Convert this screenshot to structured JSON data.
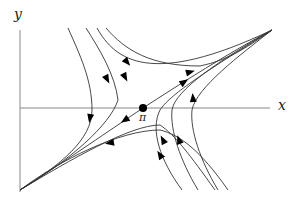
{
  "diagram": {
    "type": "phase-portrait",
    "axes": {
      "x_label": "x",
      "y_label": "y"
    },
    "equilibrium": {
      "label": "π",
      "kind": "saddle",
      "position": {
        "x": 143,
        "y": 108
      }
    },
    "colors": {
      "curve": "#333333",
      "axis": "#888888",
      "arrow": "#000000",
      "background": "#ffffff"
    },
    "curves": [
      {
        "name": "unstable-manifold",
        "path": "M20,190 C70,158 110,130 143,108 C180,84 230,52 272,30",
        "arrows": [
          {
            "x": 125,
            "y": 120,
            "angle": 146
          },
          {
            "x": 184,
            "y": 82,
            "angle": -34
          }
        ]
      },
      {
        "name": "stable-branch-upper-1",
        "path": "M68,28 C80,55 92,80 92,110 C92,140 60,165 20,190",
        "arrows": [
          {
            "x": 90,
            "y": 118,
            "angle": 100
          }
        ]
      },
      {
        "name": "stable-branch-upper-2",
        "path": "M86,28 C100,50 115,75 118,100 C110,125 70,160 20,190",
        "arrows": [
          {
            "x": 107,
            "y": 79,
            "angle": 62
          }
        ]
      },
      {
        "name": "upper-right-1",
        "path": "M97,28 C115,60 150,88 272,30",
        "arrows": [
          {
            "x": 125,
            "y": 77,
            "angle": 62
          }
        ]
      },
      {
        "name": "upper-right-2",
        "path": "M106,28 C125,50 150,66 200,66 C230,60 250,45 272,30",
        "arrows": [
          {
            "x": 127,
            "y": 62,
            "angle": 50
          },
          {
            "x": 190,
            "y": 72,
            "angle": -15
          }
        ]
      },
      {
        "name": "lower-left-1",
        "path": "M228,190 C200,150 180,135 160,130 C120,130 60,160 20,190",
        "arrows": [
          {
            "x": 110,
            "y": 143,
            "angle": 170
          }
        ]
      },
      {
        "name": "lower-left-2",
        "path": "M215,190 C190,155 175,135 160,125 C130,125 70,160 20,190",
        "arrows": [
          {
            "x": 160,
            "y": 155,
            "angle": -122
          }
        ]
      },
      {
        "name": "lower-right-1",
        "path": "M182,190 C160,160 150,130 160,110 C170,95 200,75 272,30",
        "arrows": [
          {
            "x": 163,
            "y": 140,
            "angle": -118
          }
        ]
      },
      {
        "name": "lower-right-2",
        "path": "M198,190 C180,160 170,130 172,110 C175,90 220,60 272,30",
        "arrows": [
          {
            "x": 179,
            "y": 140,
            "angle": -110
          }
        ]
      },
      {
        "name": "right-branch",
        "path": "M218,190 C200,160 190,130 192,110 C196,88 240,55 272,30",
        "arrows": [
          {
            "x": 193,
            "y": 98,
            "angle": -95
          }
        ]
      }
    ]
  }
}
